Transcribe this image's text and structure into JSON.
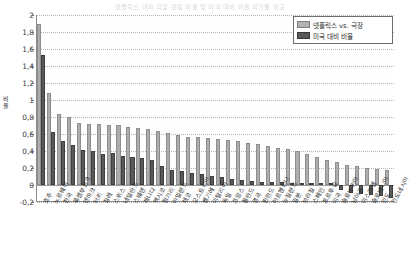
{
  "chart_data": {
    "type": "bar",
    "title": "넷플릭스 대비 극장 관람 비율 및 미국 대비 비율 국가별 비교",
    "xlabel": "",
    "ylabel": "비율",
    "ylim": [
      -0.2,
      2
    ],
    "ytick_step": 0.2,
    "ytick_labels": [
      "2",
      "1,8",
      "1,6",
      "1,4",
      "1,2",
      "1",
      "0,8",
      "0,6",
      "0,4",
      "0,2",
      "0",
      "-0,2"
    ],
    "ytick_values": [
      2,
      1.8,
      1.6,
      1.4,
      1.2,
      1,
      0.8,
      0.6,
      0.4,
      0.2,
      0,
      -0.2
    ],
    "decimal_separator": ",",
    "grid": true,
    "legend_position": "top-right",
    "categories": [
      "호주",
      "노르웨이",
      "한국",
      "룩셈부르크",
      "덴마크",
      "터키",
      "칠레",
      "스위스",
      "네덜란드",
      "스웨덴",
      "캐나다",
      "멕시코",
      "헝가리",
      "아일랜드",
      "체코",
      "오스트리아",
      "벨기에",
      "이탈리아",
      "독일",
      "프랑스",
      "폴란드",
      "영국",
      "핀란드",
      "아르헨티나",
      "뉴질랜드",
      "일본",
      "브라질",
      "스페인",
      "포르투갈",
      "미국",
      "슬로바키아",
      "남아공",
      "이스라엘",
      "슬로베니아",
      "인도",
      "인도네시아"
    ],
    "series": [
      {
        "name": "넷플릭스 vs. 극장",
        "color": "#adadad",
        "values": [
          1.9,
          1.08,
          0.84,
          0.8,
          0.73,
          0.72,
          0.72,
          0.71,
          0.71,
          0.68,
          0.67,
          0.66,
          0.64,
          0.61,
          0.59,
          0.57,
          0.56,
          0.55,
          0.54,
          0.53,
          0.52,
          0.5,
          0.48,
          0.46,
          0.44,
          0.42,
          0.4,
          0.36,
          0.33,
          0.3,
          0.27,
          0.24,
          0.22,
          0.2,
          0.19,
          0.18
        ]
      },
      {
        "name": "미국 대비 비율",
        "color": "#595959",
        "values": [
          1.53,
          0.62,
          0.52,
          0.47,
          0.41,
          0.4,
          0.37,
          0.38,
          0.34,
          0.33,
          0.32,
          0.3,
          0.22,
          0.18,
          0.16,
          0.14,
          0.13,
          0.11,
          0.09,
          0.07,
          0.06,
          0.05,
          0.04,
          0.04,
          0.03,
          0.02,
          0.02,
          0.01,
          0.01,
          0.0,
          -0.06,
          -0.09,
          -0.11,
          -0.12,
          -0.13,
          -0.15
        ]
      }
    ]
  },
  "legend": {
    "items": [
      {
        "label": "넷플릭스 vs. 극장",
        "swatch": "series-a"
      },
      {
        "label": "미국 대비 비율",
        "swatch": "series-b"
      }
    ]
  }
}
